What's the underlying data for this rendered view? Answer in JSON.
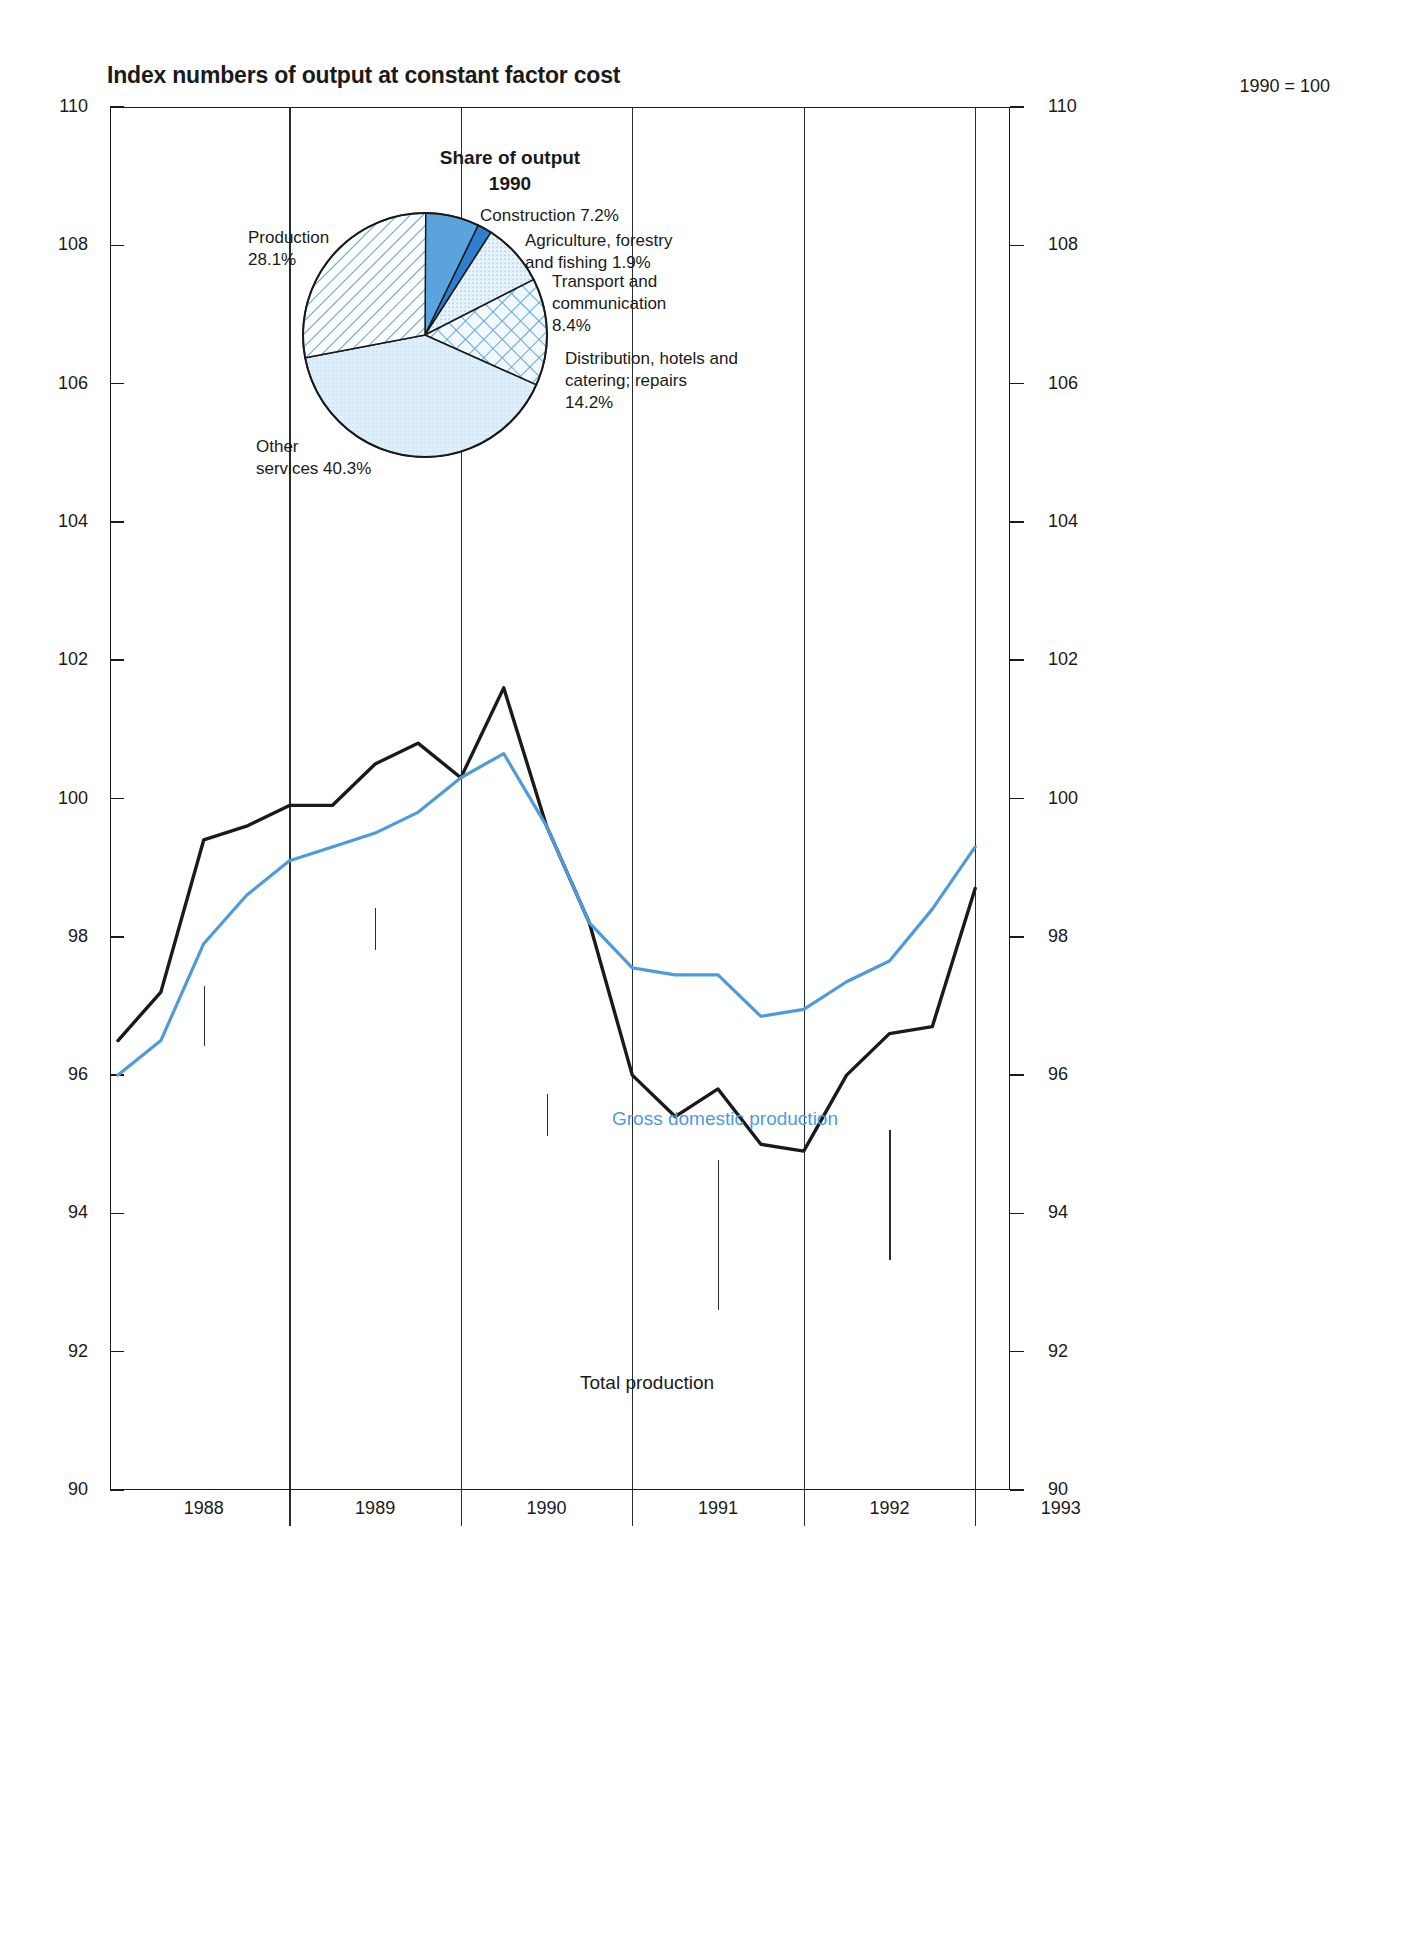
{
  "chart_data": {
    "type": "line",
    "title": "Index numbers of output at constant factor cost",
    "base_note": "1990 = 100",
    "xlabel": "",
    "ylabel": "",
    "ylim": [
      90,
      110
    ],
    "y_ticks": [
      90,
      92,
      94,
      96,
      98,
      100,
      102,
      104,
      106,
      108,
      110
    ],
    "y_tick_labels": [
      "90",
      "92",
      "94",
      "96",
      "98",
      "100",
      "102",
      "104",
      "106",
      "108",
      "110"
    ],
    "grid": false,
    "legend_position": "inline-annotation",
    "x_tick_labels": [
      "1988",
      "1989",
      "1990",
      "1991",
      "1992",
      "1993"
    ],
    "x_categories": [
      "1987 Q4",
      "1988 Q1",
      "1988 Q2",
      "1988 Q3",
      "1988 Q4",
      "1989 Q1",
      "1989 Q2",
      "1989 Q3",
      "1989 Q4",
      "1990 Q1",
      "1990 Q2",
      "1990 Q3",
      "1990 Q4",
      "1991 Q1",
      "1991 Q2",
      "1991 Q3",
      "1991 Q4",
      "1992 Q1",
      "1992 Q2",
      "1992 Q3",
      "1992 Q4",
      "1993 Q1",
      "1993 Q2"
    ],
    "series": [
      {
        "name": "Total production",
        "color": "#1a1a1a",
        "values": [
          96.5,
          97.2,
          99.4,
          99.6,
          99.9,
          99.9,
          100.5,
          100.8,
          100.3,
          101.6,
          99.6,
          98.2,
          96.0,
          95.4,
          95.8,
          95.0,
          94.9,
          96.0,
          96.6,
          96.7,
          98.7,
          null,
          null
        ]
      },
      {
        "name": "Gross domestic production",
        "color": "#4d9bdc",
        "values": [
          96.0,
          96.5,
          97.9,
          98.6,
          99.1,
          99.3,
          99.5,
          99.8,
          100.3,
          100.65,
          99.6,
          98.2,
          97.55,
          97.45,
          97.45,
          96.85,
          96.95,
          97.35,
          97.65,
          98.4,
          99.3,
          null,
          null
        ]
      }
    ],
    "pie": {
      "title": "Share of output",
      "subtitle": "1990",
      "labels": {
        "production": "Production\n28.1%",
        "construction": "Construction 7.2%",
        "agriculture": "Agriculture, forestry\nand fishing 1.9%",
        "transport": "Transport and\ncommunication\n8.4%",
        "distribution": "Distribution, hotels and\ncatering; repairs\n14.2%",
        "other": "Other\nservices 40.3%"
      },
      "slices": [
        {
          "name": "Production",
          "value": 28.1,
          "fill_style": "diagonal-hatch",
          "color": "#4d9bdc"
        },
        {
          "name": "Construction",
          "value": 7.2,
          "fill_style": "solid-blue",
          "color": "#4f93d8"
        },
        {
          "name": "Agriculture, forestry and fishing",
          "value": 1.9,
          "fill_style": "solid-blue-dark",
          "color": "#2f7fd0"
        },
        {
          "name": "Transport and communication",
          "value": 8.4,
          "fill_style": "light-dot",
          "color": "#cfe5f5"
        },
        {
          "name": "Distribution, hotels and catering; repairs",
          "value": 14.2,
          "fill_style": "cross-hatch",
          "color": "#4d9bdc"
        },
        {
          "name": "Other services",
          "value": 40.3,
          "fill_style": "pale-fill",
          "color": "#dceefa"
        }
      ]
    }
  }
}
